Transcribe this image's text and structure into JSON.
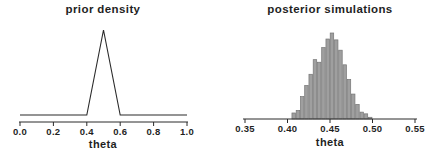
{
  "figure": {
    "background": "#ffffff",
    "text_color": "#1f1f1f",
    "line_color": "#2a2a2a"
  },
  "chart_data": [
    {
      "type": "line",
      "title": "prior density",
      "xlabel": "theta",
      "x_tick_labels": [
        "0.0",
        "0.2",
        "0.4",
        "0.6",
        "0.8",
        "1.0"
      ],
      "x_tick_values": [
        0.0,
        0.2,
        0.4,
        0.6,
        0.8,
        1.0
      ],
      "xlim": [
        0.0,
        1.0
      ],
      "ylim": [
        0,
        10.5
      ],
      "y_axis": "hidden",
      "grid": "off",
      "legend": "none",
      "points": [
        [
          0.0,
          0
        ],
        [
          0.4,
          0
        ],
        [
          0.5,
          10
        ],
        [
          0.6,
          0
        ],
        [
          1.0,
          0
        ]
      ],
      "line_color": "#2a2a2a"
    },
    {
      "type": "bar",
      "subtype": "histogram",
      "title": "posterior simulations",
      "xlabel": "theta",
      "x_tick_labels": [
        "0.35",
        "0.40",
        "0.45",
        "0.50",
        "0.55"
      ],
      "x_tick_values": [
        0.35,
        0.4,
        0.45,
        0.5,
        0.55
      ],
      "xlim": [
        0.35,
        0.55
      ],
      "ylim": [
        0,
        105
      ],
      "y_axis": "hidden",
      "grid": "off",
      "legend": "none",
      "bin_start": 0.405,
      "bin_width": 0.005,
      "heights_relative": [
        7,
        10,
        26,
        39,
        52,
        69,
        66,
        83,
        93,
        100,
        92,
        80,
        63,
        46,
        29,
        17,
        8,
        6,
        2
      ],
      "bar_fill": "#9f9f9f",
      "bar_stroke": "#757575"
    }
  ]
}
